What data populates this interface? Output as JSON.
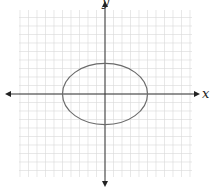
{
  "diagram": {
    "type": "ellipse-on-coordinate-grid",
    "axes": {
      "x_label": "x",
      "y_label": "y"
    },
    "grid": {
      "cells_x": 20,
      "cells_y": 19,
      "color": "#d9d9d9"
    },
    "ellipse": {
      "center": [
        0,
        0
      ],
      "semi_axis_x_cells": 5,
      "semi_axis_y_cells": 3.6,
      "color": "#6b6b6b"
    },
    "colors": {
      "axis": "#333333",
      "background": "#ffffff"
    }
  }
}
